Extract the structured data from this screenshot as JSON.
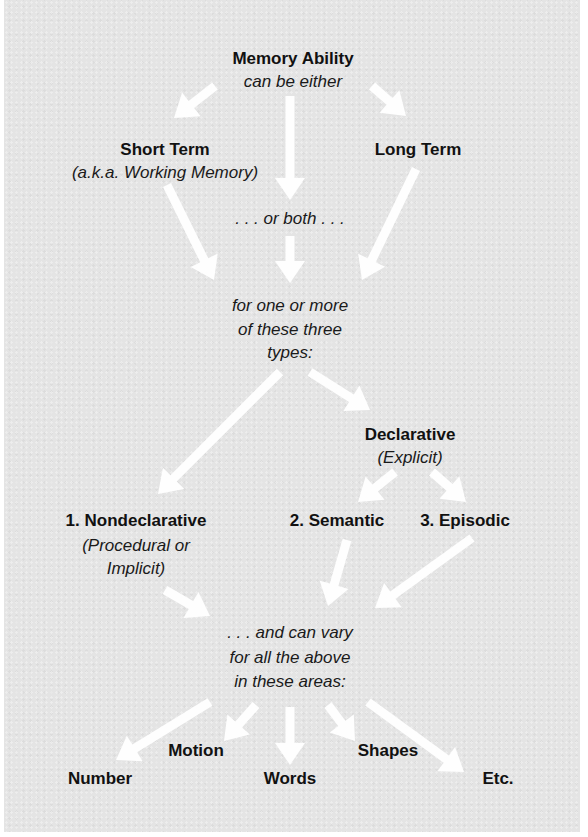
{
  "diagram": {
    "title": "Memory Ability",
    "colors": {
      "background": "#e4e4e4",
      "arrow": "#ffffff",
      "text": "#111111"
    },
    "nodes": {
      "root": {
        "label": "Memory Ability",
        "sub": "can be either"
      },
      "short_term": {
        "label": "Short Term",
        "sub": "(a.k.a. Working Memory)"
      },
      "long_term": {
        "label": "Long Term"
      },
      "or_both": {
        "label": ". . . or both . . ."
      },
      "types_intro": {
        "lines": [
          "for one or more",
          "of these three",
          "types:"
        ]
      },
      "declarative": {
        "label": "Declarative",
        "sub": "(Explicit)"
      },
      "nondeclarative": {
        "label": "1. Nondeclarative",
        "sub_lines": [
          "(Procedural or",
          "Implicit)"
        ]
      },
      "semantic": {
        "label": "2. Semantic"
      },
      "episodic": {
        "label": "3. Episodic"
      },
      "areas_intro": {
        "lines": [
          ". . . and can vary",
          "for all the above",
          "in these areas:"
        ]
      },
      "areas": {
        "motion": "Motion",
        "shapes": "Shapes",
        "number": "Number",
        "words": "Words",
        "etc": "Etc."
      }
    },
    "edges": [
      {
        "from": "root",
        "to": "short_term",
        "x1": 215,
        "y1": 86,
        "x2": 174,
        "y2": 118
      },
      {
        "from": "root",
        "to": "or_both",
        "x1": 290,
        "y1": 96,
        "x2": 290,
        "y2": 200
      },
      {
        "from": "root",
        "to": "long_term",
        "x1": 372,
        "y1": 86,
        "x2": 406,
        "y2": 116
      },
      {
        "from": "short_term",
        "to": "types_intro",
        "x1": 167,
        "y1": 185,
        "x2": 214,
        "y2": 280
      },
      {
        "from": "or_both",
        "to": "types_intro",
        "x1": 290,
        "y1": 236,
        "x2": 290,
        "y2": 283
      },
      {
        "from": "long_term",
        "to": "types_intro",
        "x1": 416,
        "y1": 169,
        "x2": 362,
        "y2": 280
      },
      {
        "from": "types_intro",
        "to": "nondeclarative",
        "x1": 280,
        "y1": 372,
        "x2": 158,
        "y2": 494
      },
      {
        "from": "types_intro",
        "to": "declarative",
        "x1": 310,
        "y1": 372,
        "x2": 370,
        "y2": 410
      },
      {
        "from": "declarative",
        "to": "semantic",
        "x1": 395,
        "y1": 472,
        "x2": 358,
        "y2": 502
      },
      {
        "from": "declarative",
        "to": "episodic",
        "x1": 432,
        "y1": 472,
        "x2": 466,
        "y2": 502
      },
      {
        "from": "nondeclarative",
        "to": "areas_intro",
        "x1": 165,
        "y1": 590,
        "x2": 210,
        "y2": 616
      },
      {
        "from": "semantic",
        "to": "areas_intro",
        "x1": 347,
        "y1": 540,
        "x2": 328,
        "y2": 606
      },
      {
        "from": "episodic",
        "to": "areas_intro",
        "x1": 472,
        "y1": 538,
        "x2": 375,
        "y2": 608
      },
      {
        "from": "areas_intro",
        "to": "number",
        "x1": 210,
        "y1": 702,
        "x2": 116,
        "y2": 760
      },
      {
        "from": "areas_intro",
        "to": "motion",
        "x1": 256,
        "y1": 705,
        "x2": 224,
        "y2": 741
      },
      {
        "from": "areas_intro",
        "to": "words",
        "x1": 290,
        "y1": 707,
        "x2": 290,
        "y2": 765
      },
      {
        "from": "areas_intro",
        "to": "shapes",
        "x1": 328,
        "y1": 705,
        "x2": 355,
        "y2": 741
      },
      {
        "from": "areas_intro",
        "to": "etc",
        "x1": 368,
        "y1": 702,
        "x2": 464,
        "y2": 772
      }
    ]
  }
}
